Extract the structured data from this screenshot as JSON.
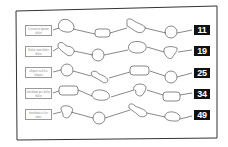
{
  "puzzle": {
    "rows": [
      {
        "label": "Lorem ut ipsum dolor",
        "number": "11",
        "label_legibility": "unreadable-approximate"
      },
      {
        "label": "Dolor sunt dolor dolor",
        "number": "19",
        "label_legibility": "unreadable-approximate"
      },
      {
        "label": "aliquet sed leo aliquet",
        "number": "25",
        "label_legibility": "unreadable-approximate"
      },
      {
        "label": "tincidunt per dolor dolor",
        "number": "34",
        "label_legibility": "unreadable-approximate"
      },
      {
        "label": "tincidunt et leo nunc",
        "number": "49",
        "label_legibility": "unreadable-approximate"
      }
    ]
  },
  "colors": {
    "outline": "#555555",
    "frame": "#333333",
    "badge_bg": "#111111",
    "badge_text": "#ffffff"
  }
}
